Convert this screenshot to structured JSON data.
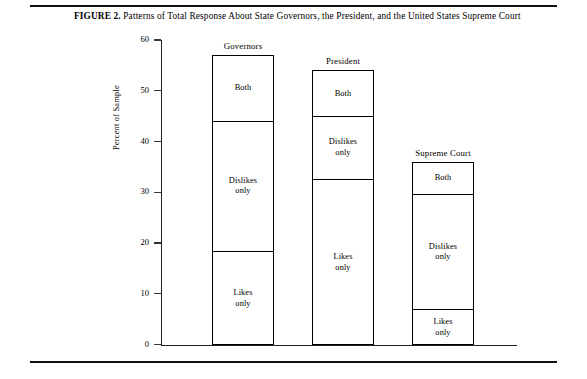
{
  "figure": {
    "label": "FIGURE 2.",
    "caption": "Patterns of Total Response About State Governors, the President, and the United States Supreme Court"
  },
  "chart_data": {
    "type": "bar",
    "title": "Patterns of Total Response About State Governors, the President, and the United States Supreme Court",
    "xlabel": "",
    "ylabel": "Percent of Sample",
    "ylim": [
      0,
      60
    ],
    "yticks": [
      0,
      10,
      20,
      30,
      40,
      50,
      60
    ],
    "ytick_labels": [
      "0",
      "10",
      "20",
      "30",
      "40",
      "50",
      "60"
    ],
    "grid": false,
    "legend": "none",
    "stacked": true,
    "categories": [
      "Governors",
      "President",
      "Supreme Court"
    ],
    "series": [
      {
        "name": "Likes only",
        "values": [
          18.5,
          32.7,
          7.0
        ]
      },
      {
        "name": "Dislikes only",
        "values": [
          25.6,
          12.3,
          22.6
        ]
      },
      {
        "name": "Both",
        "values": [
          13.0,
          9.0,
          6.4
        ]
      }
    ],
    "totals": [
      57.1,
      54.0,
      36.0
    ],
    "bars": [
      {
        "category": "Governors",
        "total": 57.1,
        "segments": [
          {
            "label": "Both",
            "from": 44.1,
            "to": 57.1,
            "value": 13.0
          },
          {
            "label": "Dislikes only",
            "from": 18.5,
            "to": 44.1,
            "value": 25.6
          },
          {
            "label": "Likes only",
            "from": 0,
            "to": 18.5,
            "value": 18.5
          }
        ]
      },
      {
        "category": "President",
        "total": 54.0,
        "segments": [
          {
            "label": "Both",
            "from": 45.0,
            "to": 54.0,
            "value": 9.0
          },
          {
            "label": "Dislikes only",
            "from": 32.7,
            "to": 45.0,
            "value": 12.3
          },
          {
            "label": "Likes only",
            "from": 0,
            "to": 32.7,
            "value": 32.7
          }
        ]
      },
      {
        "category": "Supreme Court",
        "total": 36.0,
        "segments": [
          {
            "label": "Both",
            "from": 29.6,
            "to": 36.0,
            "value": 6.4
          },
          {
            "label": "Dislikes only",
            "from": 7.0,
            "to": 29.6,
            "value": 22.6
          },
          {
            "label": "Likes only",
            "from": 0,
            "to": 7.0,
            "value": 7.0
          }
        ]
      }
    ]
  }
}
